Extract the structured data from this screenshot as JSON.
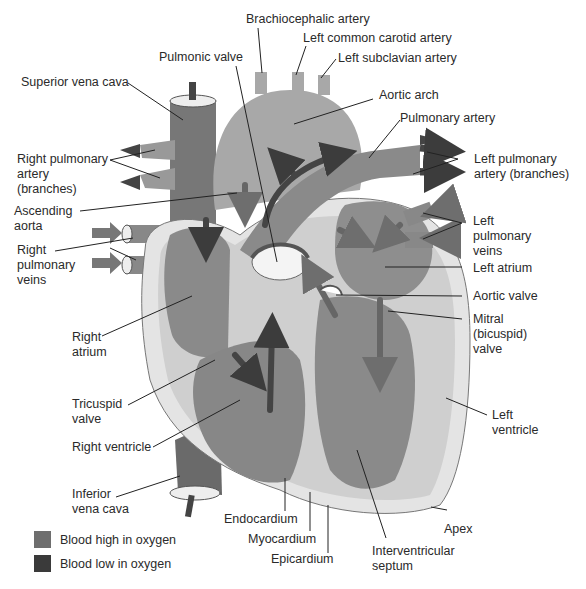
{
  "diagram": {
    "colors": {
      "high_oxygen": "#7a7a7a",
      "low_oxygen": "#3c3c3c",
      "muscle": "#cfcfcf",
      "outer_wall": "#e6e6e6",
      "chamber": "#8c8c8c",
      "aorta": "#a6a6a6"
    },
    "labels": {
      "brachiocephalic_artery": "Brachiocephalic artery",
      "left_common_carotid_artery": "Left common carotid artery",
      "left_subclavian_artery": "Left subclavian artery",
      "pulmonic_valve": "Pulmonic valve",
      "superior_vena_cava": "Superior vena cava",
      "aortic_arch": "Aortic arch",
      "pulmonary_artery": "Pulmonary artery",
      "right_pulmonary_artery": "Right pulmonary\nartery\n(branches)",
      "left_pulmonary_artery": "Left pulmonary\nartery (branches)",
      "ascending_aorta": "Ascending\naorta",
      "right_pulmonary_veins": "Right\npulmonary\nveins",
      "left_pulmonary_veins": "Left\npulmonary\nveins",
      "left_atrium": "Left atrium",
      "aortic_valve": "Aortic valve",
      "right_atrium": "Right\natrium",
      "mitral_valve": "Mitral\n(bicuspid)\nvalve",
      "tricuspid_valve": "Tricuspid\nvalve",
      "left_ventricle": "Left\nventricle",
      "right_ventricle": "Right ventricle",
      "inferior_vena_cava": "Inferior\nvena cava",
      "endocardium": "Endocardium",
      "myocardium": "Myocardium",
      "epicardium": "Epicardium",
      "interventricular_septum": "Interventricular\nseptum",
      "apex": "Apex"
    }
  },
  "legend": {
    "items": [
      {
        "label": "Blood high in oxygen",
        "color": "#6e6e6e"
      },
      {
        "label": "Blood low in oxygen",
        "color": "#3a3a3a"
      }
    ]
  }
}
